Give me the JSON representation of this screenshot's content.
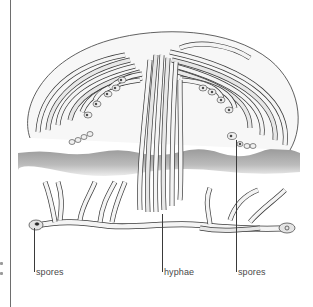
{
  "figure": {
    "colors": {
      "background": "#ffffff",
      "outline": "#3a3a3a",
      "hypha_fill": "#f4f4f4",
      "shade": "#d9d9d9",
      "soil": "#a8a8a8",
      "label_text": "#4a4a4a"
    }
  },
  "labels": [
    {
      "id": "spores-left",
      "text": "spores"
    },
    {
      "id": "hyphae",
      "text": "hyphae"
    },
    {
      "id": "spores-right",
      "text": "spores"
    }
  ]
}
